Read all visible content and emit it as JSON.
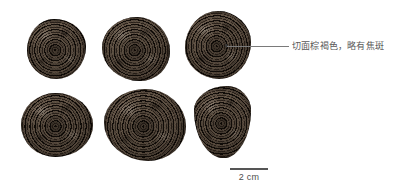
{
  "figure": {
    "background_color": "#ffffff",
    "type": "specimen-photo-plate",
    "specimen_count": 6
  },
  "specimens": [
    {
      "id": "specimen-1",
      "position": "top-left",
      "shape": "irregular-round",
      "description": "切面具同心环纹"
    },
    {
      "id": "specimen-2",
      "position": "top-center",
      "shape": "irregular-round",
      "description": "切面具同心环纹"
    },
    {
      "id": "specimen-3",
      "position": "top-right",
      "shape": "irregular-round",
      "description": "切面具同心环纹"
    },
    {
      "id": "specimen-4",
      "position": "bottom-left",
      "shape": "irregular-round",
      "description": "切面具同心环纹"
    },
    {
      "id": "specimen-5",
      "position": "bottom-center",
      "shape": "irregular-round",
      "description": "切面具同心环纹"
    },
    {
      "id": "specimen-6",
      "position": "bottom-right",
      "shape": "teardrop",
      "description": "切面具同心环纹"
    }
  ],
  "annotation": {
    "text": "切面棕褐色，略有焦斑",
    "color": "#595959",
    "target": "specimen-3",
    "leader_line_color": "#7a7a7a"
  },
  "scale_bar": {
    "label": "2 cm",
    "color": "#4d4d4d",
    "line_color": "#555555"
  }
}
